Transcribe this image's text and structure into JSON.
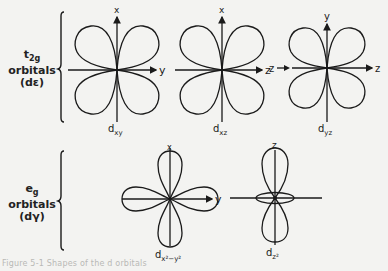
{
  "figure": {
    "type": "d-orbital shapes diagram",
    "caption": "Figure 5-1 Shapes of the d orbitals",
    "colors": {
      "ink": "#1a1a1a",
      "paper": "#f3f3f1"
    }
  },
  "groups": [
    {
      "id": "t2g",
      "line1": "t2g",
      "line1_main": "t",
      "line1_sub": "2g",
      "line2": "orbitals",
      "line3": "(dε)"
    },
    {
      "id": "eg",
      "line1": "eg",
      "line1_main": "e",
      "line1_sub": "g",
      "line2": "orbitals",
      "line3": "(dγ)"
    }
  ],
  "orbitals": [
    {
      "id": "dxy",
      "label_main": "d",
      "label_sub": "xy",
      "vertical_axis": "x",
      "horizontal_axis": "y",
      "group": "t2g"
    },
    {
      "id": "dxz",
      "label_main": "d",
      "label_sub": "xz",
      "vertical_axis": "x",
      "horizontal_axis": "z",
      "group": "t2g"
    },
    {
      "id": "dyz",
      "label_main": "d",
      "label_sub": "yz",
      "vertical_axis": "y",
      "horizontal_axis": "z",
      "horizontal_axis_left": "z",
      "group": "t2g"
    },
    {
      "id": "dx2-y2",
      "label_main": "d",
      "label_sub": "x²−y²",
      "vertical_axis": "x",
      "horizontal_axis": "y",
      "group": "eg"
    },
    {
      "id": "dz2",
      "label_main": "d",
      "label_sub": "z²",
      "vertical_axis": "z",
      "group": "eg"
    }
  ]
}
